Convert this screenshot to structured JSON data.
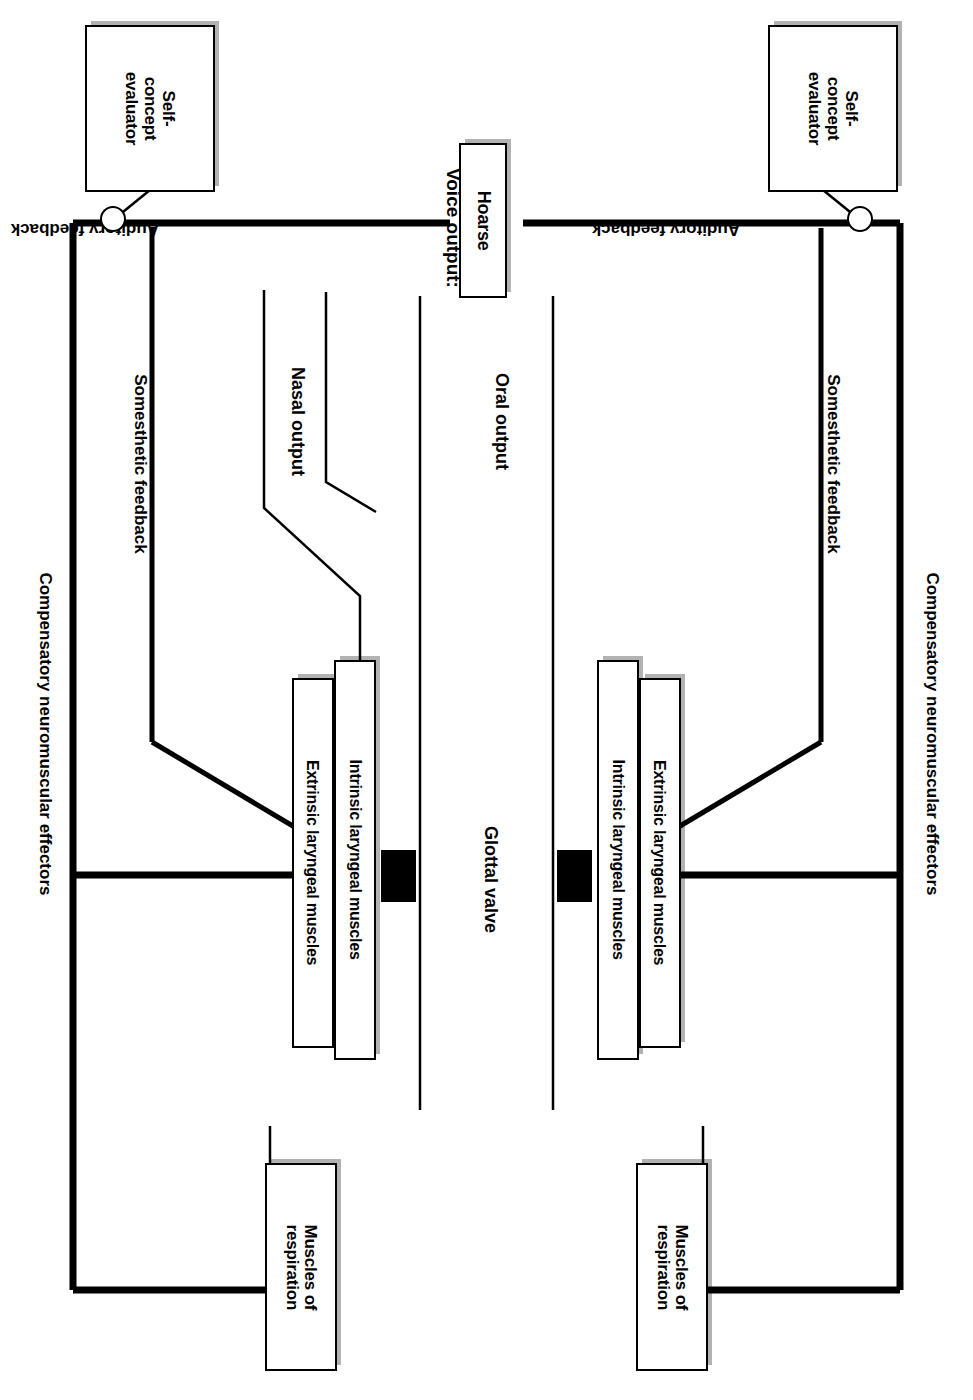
{
  "diagram": {
    "orientation": "rotated-90",
    "ink_color": "#000000",
    "background_color": "#ffffff",
    "nodes": {
      "self_concept_evaluator_left": "Self-\nconcept\nevaluator",
      "self_concept_evaluator_left_line1": "Self-",
      "self_concept_evaluator_left_line2": "concept",
      "self_concept_evaluator_left_line3": "evaluator",
      "self_concept_evaluator_right_line1": "Self-",
      "self_concept_evaluator_right_line2": "concept",
      "self_concept_evaluator_right_line3": "evaluator",
      "voice_output_value": "Hoarse",
      "extrinsic_left": "Extrinsic laryngeal muscles",
      "intrinsic_left": "Intrinsic laryngeal muscles",
      "intrinsic_right": "Intrinsic laryngeal muscles",
      "extrinsic_right": "Extrinsic laryngeal muscles",
      "muscles_respiration_left_line1": "Muscles of",
      "muscles_respiration_left_line2": "respiration",
      "muscles_respiration_right_line1": "Muscles of",
      "muscles_respiration_right_line2": "respiration"
    },
    "labels": {
      "voice_output_caption": "Voice output:",
      "auditory_feedback_left": "Auditory feedback",
      "auditory_feedback_right": "Auditory feedback",
      "somesthetic_feedback_left": "Somesthetic feedback",
      "somesthetic_feedback_right": "Somesthetic feedback",
      "compensatory_left": "Compensatory neuromuscular effectors",
      "compensatory_right": "Compensatory neuromuscular effectors",
      "nasal_output": "Nasal output",
      "oral_output": "Oral output",
      "glottal_valve": "Glottal valve"
    }
  }
}
